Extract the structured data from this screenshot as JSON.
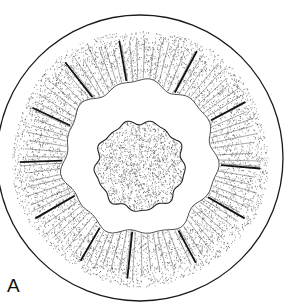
{
  "figure": {
    "panel_label": "A",
    "top_cut_text": "· · · · · · · ·",
    "colors": {
      "ink": "#1a1a1a",
      "stipple": "#333333",
      "background": "#ffffff"
    },
    "geometry": {
      "center": [
        140,
        158
      ],
      "outer_circle_r": 143,
      "ring_outer_r": 128,
      "ring_inner_r": 76,
      "core_center": [
        140,
        166
      ],
      "core_r": 44
    },
    "heavy_striation_angles_deg": [
      -100,
      -62,
      -28,
      5,
      30,
      62,
      96,
      120,
      150,
      178,
      205,
      232
    ],
    "light_striation_count": 90
  }
}
